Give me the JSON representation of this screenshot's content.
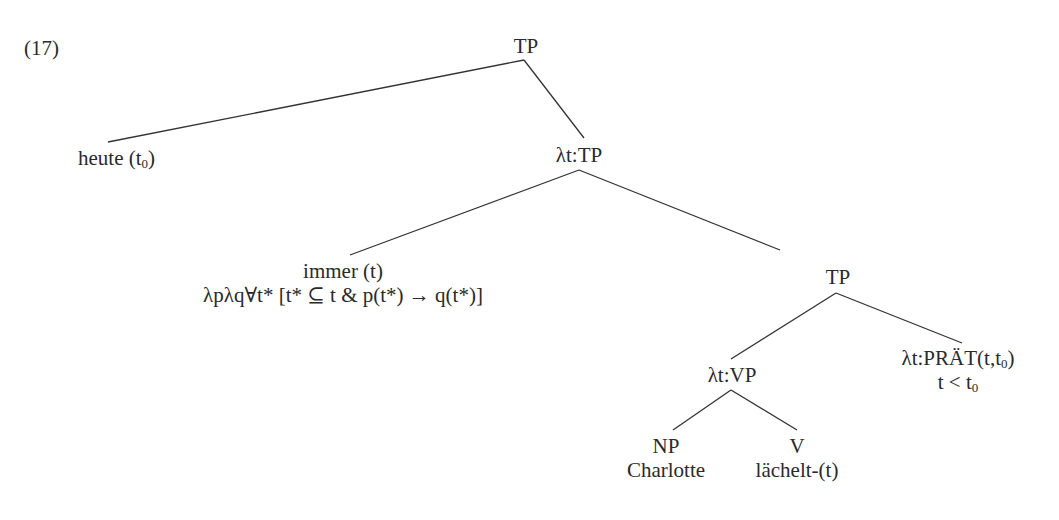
{
  "example_number": "(17)",
  "nodes": {
    "root": {
      "label": "TP"
    },
    "heute": {
      "label": "heute (t",
      "sub": "0",
      "tail": ")"
    },
    "lambda_tp": {
      "label": "λt:TP"
    },
    "immer": {
      "line1": "immer (t)",
      "line2": "λpλq∀t* [t* ⊆ t & p(t*) → q(t*)]"
    },
    "tp_inner": {
      "label": "TP"
    },
    "lambda_vp": {
      "label": "λt:VP"
    },
    "praet": {
      "line1a": "λt:PRÄT(t,t",
      "line1sub": "0",
      "line1b": ")",
      "line2a": "t < t",
      "line2sub": "0"
    },
    "np": {
      "cat": "NP",
      "word": "Charlotte"
    },
    "v": {
      "cat": "V",
      "word": "lächelt-(t)"
    }
  },
  "edges": [
    {
      "from": "TP",
      "to": "heute (t0)"
    },
    {
      "from": "TP",
      "to": "λt:TP"
    },
    {
      "from": "λt:TP",
      "to": "immer (t)"
    },
    {
      "from": "λt:TP",
      "to": "TP"
    },
    {
      "from": "TP",
      "to": "λt:VP"
    },
    {
      "from": "TP",
      "to": "λt:PRÄT(t,t0)"
    },
    {
      "from": "λt:VP",
      "to": "NP"
    },
    {
      "from": "λt:VP",
      "to": "V"
    }
  ]
}
